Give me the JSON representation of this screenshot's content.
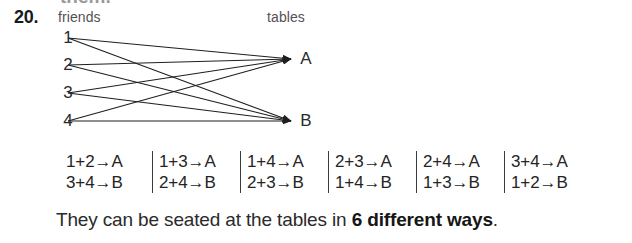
{
  "page": {
    "top_clipped_text": "them.",
    "question_number": "20.",
    "conclusion_prefix": "They can be seated at the tables in ",
    "conclusion_emphasis": "6 different ways",
    "conclusion_suffix": "."
  },
  "diagram": {
    "left_caption": "friends",
    "right_caption": "tables",
    "left_nodes": [
      {
        "id": "n1",
        "label": "1",
        "x": 68,
        "y": 14
      },
      {
        "id": "n2",
        "label": "2",
        "x": 68,
        "y": 41
      },
      {
        "id": "n3",
        "label": "3",
        "x": 68,
        "y": 69
      },
      {
        "id": "n4",
        "label": "4",
        "x": 68,
        "y": 97
      }
    ],
    "right_nodes": [
      {
        "id": "A",
        "label": "A",
        "x": 300,
        "y": 35
      },
      {
        "id": "B",
        "label": "B",
        "x": 300,
        "y": 97
      }
    ],
    "edges": [
      {
        "from": "n1",
        "to": "A"
      },
      {
        "from": "n1",
        "to": "B"
      },
      {
        "from": "n2",
        "to": "A"
      },
      {
        "from": "n2",
        "to": "B"
      },
      {
        "from": "n3",
        "to": "A"
      },
      {
        "from": "n3",
        "to": "B"
      },
      {
        "from": "n4",
        "to": "A"
      },
      {
        "from": "n4",
        "to": "B"
      }
    ],
    "line_color": "#1f1f1f"
  },
  "pairings": {
    "columns": [
      {
        "top": "1+2→A",
        "bottom": "3+4→B"
      },
      {
        "top": "1+3→A",
        "bottom": "2+4→B"
      },
      {
        "top": "1+4→A",
        "bottom": "2+3→B"
      },
      {
        "top": "2+3→A",
        "bottom": "1+4→B"
      },
      {
        "top": "2+4→A",
        "bottom": "1+3→B"
      },
      {
        "top": "3+4→A",
        "bottom": "1+2→B"
      }
    ]
  }
}
